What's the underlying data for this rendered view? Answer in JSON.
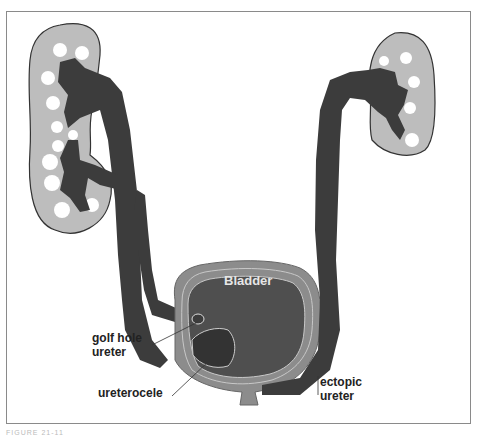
{
  "figure": {
    "caption": "FIGURE 21-11",
    "labels": {
      "bladder": "Bladder",
      "golf_hole_ureter_line1": "golf hole",
      "golf_hole_ureter_line2": "ureter",
      "ureterocele": "ureterocele",
      "ectopic_ureter_line1": "ectopic",
      "ectopic_ureter_line2": "ureter"
    },
    "colors": {
      "kidney_fill": "#bdbdbd",
      "collecting_system": "#3c3c3c",
      "bladder_fill": "#4f4f4f",
      "bladder_wall": "#8c8c8c",
      "calyx_white": "#ffffff",
      "frame_border": "#8a8a8a"
    }
  }
}
